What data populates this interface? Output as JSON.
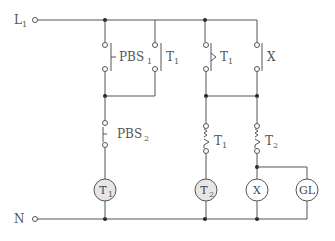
{
  "diagram": {
    "type": "relay ladder / sequence control circuit",
    "rails": {
      "top": {
        "label": "L",
        "subscript": "1"
      },
      "bottom": {
        "label": "N",
        "subscript": ""
      }
    },
    "contacts": [
      {
        "id": "pbs1",
        "label": "PBS",
        "subscript": "1",
        "kind": "push-button NO"
      },
      {
        "id": "t1_hold",
        "label": "T",
        "subscript": "1",
        "kind": "NO contact"
      },
      {
        "id": "t1_timed_no",
        "label": "T",
        "subscript": "1",
        "kind": "timed NO contact"
      },
      {
        "id": "x_hold",
        "label": "X",
        "subscript": "",
        "kind": "NO contact"
      },
      {
        "id": "pbs2",
        "label": "PBS",
        "subscript": "2",
        "kind": "push-button NC"
      },
      {
        "id": "t1_timed_nc",
        "label": "T",
        "subscript": "1",
        "kind": "timed NC contact"
      },
      {
        "id": "t2_timed_nc",
        "label": "T",
        "subscript": "2",
        "kind": "timed NC contact"
      }
    ],
    "loads": [
      {
        "id": "coil_t1",
        "label": "T",
        "subscript": "1",
        "fill": "#e6e6e6"
      },
      {
        "id": "coil_t2",
        "label": "T",
        "subscript": "2",
        "fill": "#e6e6e6"
      },
      {
        "id": "coil_x",
        "label": "X",
        "subscript": "",
        "fill": "#ffffff"
      },
      {
        "id": "lamp_gl",
        "label": "GL",
        "subscript": "",
        "fill": "#ffffff"
      }
    ],
    "colors": {
      "line": "#555555",
      "coil_fill": "#e6e6e6",
      "background": "#ffffff"
    }
  }
}
